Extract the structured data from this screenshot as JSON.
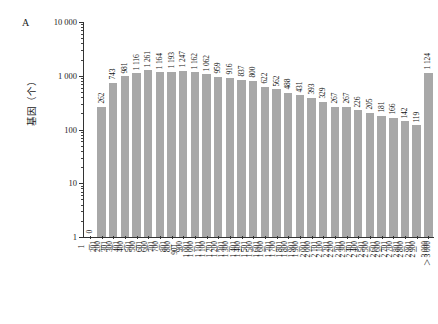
{
  "panel": {
    "label": "A"
  },
  "axes": {
    "y_title": "基因（个）",
    "y_ticks": [
      "10 000",
      "1 000",
      "100",
      "10",
      "1"
    ],
    "x_title": ""
  },
  "chart_data": {
    "type": "bar",
    "title": "",
    "subtitle": "",
    "xlabel": "",
    "ylabel": "基因（个）",
    "yscale": "log",
    "ylim": [
      1,
      10000
    ],
    "ytick_labels": [
      "1",
      "10",
      "100",
      "1 000",
      "10 000"
    ],
    "grid": false,
    "legend": null,
    "bar_color": "#a8a8a8",
    "categories": [
      "1－200",
      "201－300",
      "301－400",
      "401－500",
      "501－600",
      "601－700",
      "701－800",
      "801－900",
      "901－1 000",
      "1 001－1 100",
      "1 101－1 200",
      "1 201－1 300",
      "1 301－1 400",
      "1 401－1 500",
      "1 501－1 600",
      "1 601－1 700",
      "1 701－1 800",
      "1 801－1 900",
      "1 901－2 000",
      "2 001－2 100",
      "2 101－2 200",
      "2 201－2 300",
      "2 301－2 400",
      "2 401－2 500",
      "2 501－2 600",
      "2 601－2 700",
      "2 701－2 800",
      "2 801－2 900",
      "2 901－3 000",
      "＞3 000"
    ],
    "values": [
      0,
      262,
      743,
      981,
      1116,
      1261,
      1164,
      1193,
      1247,
      1162,
      1062,
      959,
      916,
      837,
      800,
      622,
      562,
      488,
      431,
      393,
      329,
      267,
      267,
      226,
      205,
      181,
      166,
      142,
      119,
      1124
    ],
    "value_labels": [
      "0",
      "262",
      "743",
      "981",
      "1 116",
      "1 261",
      "1 164",
      "1 193",
      "1 247",
      "1 162",
      "1 062",
      "959",
      "916",
      "837",
      "800",
      "622",
      "562",
      "488",
      "431",
      "393",
      "329",
      "267",
      "267",
      "226",
      "205",
      "181",
      "166",
      "142",
      "119",
      "1 124"
    ]
  }
}
